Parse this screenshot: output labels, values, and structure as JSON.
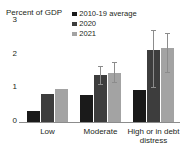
{
  "title_sliver": "Grants and concessional loans",
  "axis": {
    "unit_label": "Percent of GDP",
    "ticks": [
      "0",
      "1",
      "2",
      "3"
    ]
  },
  "legend": {
    "items": [
      {
        "label": "2010-19 average",
        "color": "#1a1a1a"
      },
      {
        "label": "2020",
        "color": "#3d3d3d"
      },
      {
        "label": "2021",
        "color": "#a3a3a3"
      }
    ]
  },
  "chart_data": {
    "type": "bar",
    "title": "Percent of GDP",
    "xlabel": "",
    "ylabel": "Percent of GDP",
    "ylim": [
      0,
      3
    ],
    "yticks": [
      0,
      1,
      2,
      3
    ],
    "grid": false,
    "legend_position": "top-right",
    "categories": [
      "Low",
      "Moderate",
      "High or in debt distress"
    ],
    "series": [
      {
        "name": "2010-19 average",
        "color": "#1a1a1a",
        "values": [
          0.33,
          0.8,
          0.95
        ],
        "errors": [
          null,
          null,
          null
        ]
      },
      {
        "name": "2020",
        "color": "#3d3d3d",
        "values": [
          0.82,
          1.4,
          2.15
        ],
        "errors": [
          null,
          {
            "low": 1.1,
            "high": 1.62
          },
          {
            "low": 1.0,
            "high": 2.7
          }
        ]
      },
      {
        "name": "2021",
        "color": "#a3a3a3",
        "values": [
          0.97,
          1.45,
          2.2
        ],
        "errors": [
          null,
          {
            "low": 1.15,
            "high": 1.75
          },
          {
            "low": 1.45,
            "high": 2.6
          }
        ]
      }
    ]
  }
}
